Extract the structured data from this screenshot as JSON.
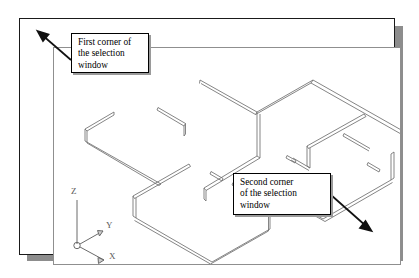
{
  "scene": {
    "kind": "autocad-isometric-floorplan",
    "background_color": "#ffffff",
    "sheet_border_color": "#1a1a1a",
    "viewport_border_color": "#8f8f8f",
    "shadow_color": "#8d8d8d",
    "wall_line_color": "#707070",
    "callout_border_color": "#000000",
    "callout_fill_color": "#ffffff",
    "arrow_color": "#111111"
  },
  "callouts": [
    {
      "id": "first-corner",
      "line1": "First corner of",
      "line2": "the selection",
      "line3": "window"
    },
    {
      "id": "second-corner",
      "line1": "Second corner",
      "line2": "of the selection",
      "line3": "window"
    }
  ],
  "ucs_icon": {
    "name": "ucs-axis-icon",
    "axes": [
      {
        "label": "Z",
        "direction": "up"
      },
      {
        "label": "Y",
        "direction": "upper-right"
      },
      {
        "label": "X",
        "direction": "lower-right"
      }
    ]
  },
  "pointers": [
    {
      "id": "first-corner-arrow",
      "from": "callout-first-left",
      "to": "upper-left-of-viewport",
      "direction": "up-left"
    },
    {
      "id": "second-corner-arrow",
      "from": "callout-second-right",
      "to": "lower-right-of-viewport",
      "direction": "down-right"
    }
  ],
  "drawing": {
    "description": "Isometric view of a double-line wall floor plan",
    "wall_style": "double-line",
    "projection": "isometric"
  }
}
